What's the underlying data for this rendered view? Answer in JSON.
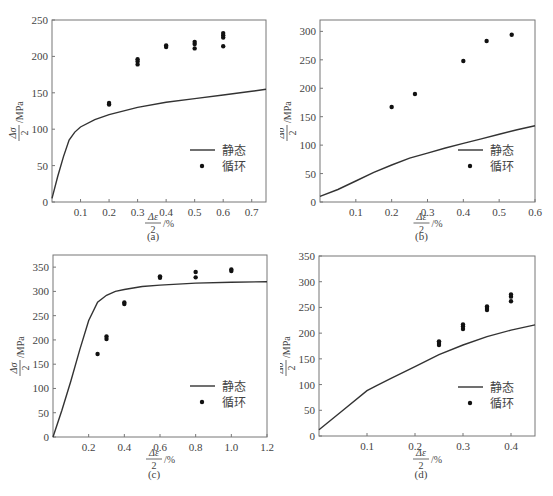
{
  "figure": {
    "legend": {
      "static_label": "静态",
      "cyclic_label": "循环"
    },
    "xlabel_num": "Δε",
    "xlabel_den": "2",
    "xlabel_unit": "/%",
    "ylabel_num": "Δσ",
    "ylabel_den": "2",
    "ylabel_unit": "/MPa"
  },
  "chart_data": [
    {
      "id": "a",
      "type": "line+scatter",
      "caption": "(a)",
      "xlabel": "Δε/2 /%",
      "ylabel": "Δσ/2 /MPa",
      "xlim": [
        0,
        0.75
      ],
      "ylim": [
        0,
        250
      ],
      "xticks": [
        0.1,
        0.2,
        0.3,
        0.4,
        0.5,
        0.6,
        0.7
      ],
      "yticks": [
        0,
        50,
        100,
        150,
        200,
        250
      ],
      "legend": [
        "静态",
        "循环"
      ],
      "legend_position": "lower right",
      "grid": false,
      "series": [
        {
          "name": "静态",
          "kind": "line",
          "x": [
            0,
            0.02,
            0.04,
            0.06,
            0.08,
            0.1,
            0.15,
            0.2,
            0.3,
            0.4,
            0.5,
            0.6,
            0.7,
            0.75
          ],
          "y": [
            5,
            35,
            62,
            85,
            96,
            103,
            113,
            120,
            130,
            137,
            142,
            147,
            152,
            155
          ]
        },
        {
          "name": "循环",
          "kind": "scatter",
          "x": [
            0.2,
            0.2,
            0.3,
            0.3,
            0.3,
            0.4,
            0.4,
            0.5,
            0.5,
            0.5,
            0.6,
            0.6,
            0.6,
            0.6
          ],
          "y": [
            134,
            136,
            189,
            193,
            196,
            213,
            215,
            211,
            217,
            220,
            214,
            226,
            229,
            232
          ]
        }
      ]
    },
    {
      "id": "b",
      "type": "line+scatter",
      "caption": "(b)",
      "xlabel": "Δε/2 /%",
      "ylabel": "Δσ/2 /MPa",
      "xlim": [
        0,
        0.6
      ],
      "ylim": [
        0,
        320
      ],
      "xticks": [
        0.1,
        0.2,
        0.3,
        0.4,
        0.5,
        0.6
      ],
      "yticks": [
        0,
        50,
        100,
        150,
        200,
        250,
        300
      ],
      "legend": [
        "静态",
        "循环"
      ],
      "legend_position": "lower right",
      "grid": false,
      "series": [
        {
          "name": "静态",
          "kind": "line",
          "x": [
            0,
            0.05,
            0.1,
            0.15,
            0.2,
            0.25,
            0.3,
            0.35,
            0.4,
            0.45,
            0.5,
            0.55,
            0.6
          ],
          "y": [
            10,
            22,
            37,
            52,
            65,
            77,
            86,
            95,
            103,
            111,
            119,
            127,
            134
          ]
        },
        {
          "name": "循环",
          "kind": "scatter",
          "x": [
            0.2,
            0.265,
            0.4,
            0.465,
            0.535
          ],
          "y": [
            167,
            190,
            248,
            283,
            294
          ]
        }
      ]
    },
    {
      "id": "c",
      "type": "line+scatter",
      "caption": "(c)",
      "xlabel": "Δε/2 /%",
      "ylabel": "Δσ/2 /MPa",
      "xlim": [
        0,
        1.2
      ],
      "ylim": [
        0,
        375
      ],
      "xticks": [
        0.2,
        0.4,
        0.6,
        0.8,
        1.0,
        1.2
      ],
      "yticks": [
        0,
        50,
        100,
        150,
        200,
        250,
        300,
        350
      ],
      "legend": [
        "静态",
        "循环"
      ],
      "legend_position": "lower right",
      "grid": false,
      "series": [
        {
          "name": "静态",
          "kind": "line",
          "x": [
            0,
            0.05,
            0.1,
            0.15,
            0.2,
            0.25,
            0.3,
            0.35,
            0.4,
            0.5,
            0.6,
            0.8,
            1.0,
            1.2
          ],
          "y": [
            0,
            55,
            115,
            180,
            240,
            278,
            292,
            300,
            304,
            310,
            313,
            317,
            319,
            320
          ]
        },
        {
          "name": "循环",
          "kind": "scatter",
          "x": [
            0.25,
            0.3,
            0.3,
            0.4,
            0.4,
            0.6,
            0.6,
            0.8,
            0.8,
            1.0,
            1.0
          ],
          "y": [
            171,
            202,
            207,
            274,
            277,
            328,
            331,
            329,
            340,
            342,
            345
          ]
        }
      ]
    },
    {
      "id": "d",
      "type": "line+scatter",
      "caption": "(d)",
      "xlabel": "Δε/2 /%",
      "ylabel": "Δσ/2 /MPa",
      "xlim": [
        0,
        0.45
      ],
      "ylim": [
        0,
        350
      ],
      "xticks": [
        0.1,
        0.2,
        0.3,
        0.4
      ],
      "yticks": [
        0,
        50,
        100,
        150,
        200,
        250,
        300,
        350
      ],
      "legend": [
        "静态",
        "循环"
      ],
      "legend_position": "lower right",
      "grid": false,
      "series": [
        {
          "name": "静态",
          "kind": "line",
          "x": [
            0,
            0.05,
            0.1,
            0.12,
            0.15,
            0.2,
            0.25,
            0.3,
            0.35,
            0.4,
            0.45
          ],
          "y": [
            12,
            50,
            88,
            98,
            112,
            135,
            158,
            177,
            193,
            206,
            216
          ]
        },
        {
          "name": "循环",
          "kind": "scatter",
          "x": [
            0.25,
            0.25,
            0.25,
            0.3,
            0.3,
            0.3,
            0.35,
            0.35,
            0.35,
            0.4,
            0.4,
            0.4
          ],
          "y": [
            177,
            181,
            184,
            208,
            213,
            217,
            245,
            249,
            252,
            262,
            271,
            275
          ]
        }
      ]
    }
  ]
}
